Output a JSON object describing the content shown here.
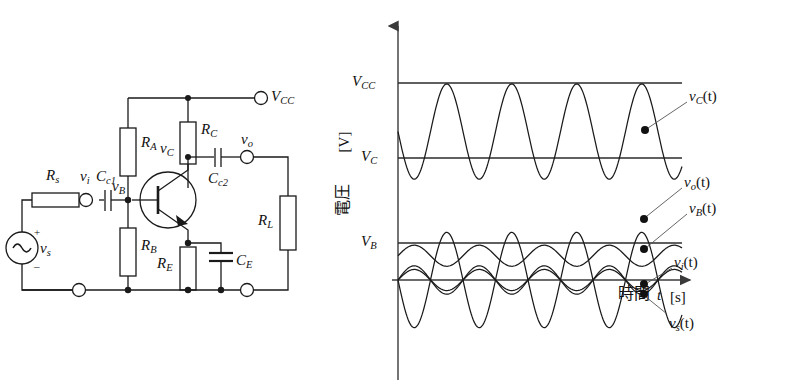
{
  "circuit": {
    "labels": {
      "rs": "R",
      "rs_sub": "s",
      "vi": "v",
      "vi_sub": "i",
      "cc1": "C",
      "cc1_sub": "c1",
      "vb": "v",
      "vb_sub": "B",
      "ra": "R",
      "ra_sub": "A",
      "rb": "R",
      "rb_sub": "B",
      "rc": "R",
      "rc_sub": "C",
      "re": "R",
      "re_sub": "E",
      "ce": "C",
      "ce_sub": "E",
      "cc2": "C",
      "cc2_sub": "c2",
      "vc": "v",
      "vc_sub": "C",
      "vo": "v",
      "vo_sub": "o",
      "rl": "R",
      "rl_sub": "L",
      "vcc": "V",
      "vcc_sub": "CC",
      "vs": "v",
      "vs_sub": "s",
      "source_plus": "+",
      "source_minus": "_"
    },
    "components": [
      {
        "name": "source-vs",
        "type": "ac-source",
        "label": "v_s"
      },
      {
        "name": "resistor-rs",
        "type": "resistor",
        "label": "R_s"
      },
      {
        "name": "capacitor-cc1",
        "type": "capacitor",
        "label": "C_c1"
      },
      {
        "name": "resistor-ra",
        "type": "resistor",
        "label": "R_A"
      },
      {
        "name": "resistor-rb",
        "type": "resistor",
        "label": "R_B"
      },
      {
        "name": "resistor-rc",
        "type": "resistor",
        "label": "R_C"
      },
      {
        "name": "resistor-re",
        "type": "resistor",
        "label": "R_E"
      },
      {
        "name": "capacitor-ce",
        "type": "capacitor",
        "label": "C_E"
      },
      {
        "name": "capacitor-cc2",
        "type": "capacitor",
        "label": "C_c2"
      },
      {
        "name": "resistor-rl",
        "type": "resistor",
        "label": "R_L"
      },
      {
        "name": "transistor-q1",
        "type": "npn-bjt",
        "label": ""
      }
    ],
    "terminals": [
      "V_CC",
      "v_i",
      "v_o",
      "ground-left",
      "ground-right"
    ]
  },
  "graph": {
    "y_axis_label_cjk": "電圧",
    "y_axis_unit": "[V]",
    "x_axis_label_cjk": "時間",
    "x_axis_var": "t",
    "x_axis_unit": "[s]",
    "level_labels": [
      {
        "name": "vcc-level",
        "base": "V",
        "sub": "CC"
      },
      {
        "name": "vc-level",
        "base": "V",
        "sub": "C"
      },
      {
        "name": "vb-level",
        "base": "V",
        "sub": "B"
      }
    ],
    "curve_labels": [
      {
        "name": "vc-curve-label",
        "base": "v",
        "sub": "C",
        "suffix": "(t)"
      },
      {
        "name": "vo-curve-label",
        "base": "v",
        "sub": "o",
        "suffix": "(t)"
      },
      {
        "name": "vb-curve-label",
        "base": "v",
        "sub": "B",
        "suffix": "(t)"
      },
      {
        "name": "vi-curve-label",
        "base": "v",
        "sub": "i",
        "suffix": "(t)"
      },
      {
        "name": "vs-curve-label",
        "base": "v",
        "sub": "s",
        "suffix": "(t)"
      }
    ]
  },
  "chart_data": {
    "type": "line",
    "title": "",
    "xlabel": "時間 t [s]",
    "ylabel": "電圧 [V]",
    "xlim": [
      0,
      4.35
    ],
    "ylim": [
      -1.55,
      2.45
    ],
    "grid": false,
    "legend": "inline-annotations",
    "x_units": "periods",
    "levels": [
      {
        "name": "V_CC",
        "value": 2.15
      },
      {
        "name": "V_C",
        "value": 1.26
      },
      {
        "name": "V_B",
        "value": 0.265
      }
    ],
    "zero_line": 0,
    "period_px": 65,
    "series": [
      {
        "name": "v_C(t)",
        "dc_offset": 1.62,
        "amplitude": 0.52,
        "phase_deg": 180,
        "note": "inverted relative to v_B; swings between ~V_C and just below V_CC"
      },
      {
        "name": "v_o(t)",
        "dc_offset": 0.0,
        "amplitude": 0.52,
        "phase_deg": 180,
        "note": "AC-coupled version of v_C, centred on zero, largest small-signal amplitude"
      },
      {
        "name": "v_B(t)",
        "dc_offset": 0.265,
        "amplitude": 0.115,
        "phase_deg": 0,
        "note": "base voltage riding on bias level V_B"
      },
      {
        "name": "v_i(t)",
        "dc_offset": 0.0,
        "amplitude": 0.115,
        "phase_deg": 0,
        "note": "input after source resistance, centred on zero"
      },
      {
        "name": "v_s(t)",
        "dc_offset": 0.0,
        "amplitude": 0.155,
        "phase_deg": 0,
        "note": "source voltage, slightly larger than v_i"
      }
    ],
    "annotation_dots": [
      {
        "series": "v_C(t)",
        "x_px": 645,
        "y_px": 130
      },
      {
        "series": "v_o(t)",
        "x_px": 644,
        "y_px": 219
      },
      {
        "series": "v_B(t)",
        "x_px": 644,
        "y_px": 249
      },
      {
        "series": "v_i(t)",
        "x_px": 644,
        "y_px": 284
      },
      {
        "series": "v_s(t)",
        "x_px": 644,
        "y_px": 294
      }
    ]
  }
}
